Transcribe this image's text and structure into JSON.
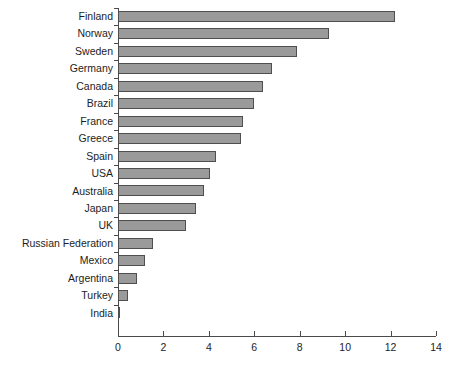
{
  "chart_data": {
    "type": "bar",
    "orientation": "horizontal",
    "title": "",
    "subtitle": "",
    "xlabel": "",
    "ylabel": "",
    "xlim": [
      0,
      14
    ],
    "ylim": null,
    "grid": false,
    "legend": null,
    "xticks": [
      "0",
      "2",
      "4",
      "6",
      "8",
      "10",
      "12",
      "14"
    ],
    "xtick_values": [
      0,
      2,
      4,
      6,
      8,
      10,
      12,
      14
    ],
    "categories": [
      "Finland",
      "Norway",
      "Sweden",
      "Germany",
      "Canada",
      "Brazil",
      "France",
      "Greece",
      "Spain",
      "USA",
      "Australia",
      "Japan",
      "UK",
      "Russian Federation",
      "Mexico",
      "Argentina",
      "Turkey",
      "India"
    ],
    "values": [
      12.2,
      9.3,
      7.9,
      6.8,
      6.4,
      6.0,
      5.5,
      5.4,
      4.3,
      4.05,
      3.8,
      3.45,
      3.0,
      1.55,
      1.2,
      0.85,
      0.45,
      0.1
    ],
    "colors": {
      "bar_fill": "#9a9a9a",
      "bar_border": "#4f4f4f",
      "axis": "#4a4a4a",
      "text": "#1d1d1d",
      "background": "#ffffff"
    }
  }
}
